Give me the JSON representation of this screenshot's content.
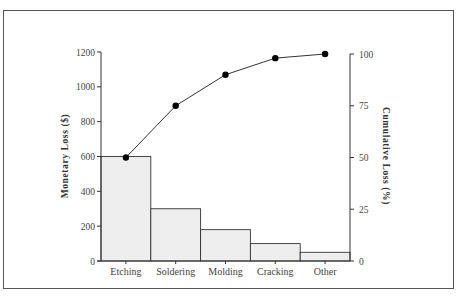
{
  "chart_data": {
    "type": "bar",
    "subtype": "pareto",
    "title": "",
    "categories": [
      "Etching",
      "Soldering",
      "Molding",
      "Cracking",
      "Other"
    ],
    "series": [
      {
        "name": "Monetary Loss ($)",
        "type": "bar",
        "axis": "left",
        "values": [
          600,
          300,
          180,
          100,
          50
        ]
      },
      {
        "name": "Cumulative Loss (%)",
        "type": "line",
        "axis": "right",
        "values": [
          50,
          75,
          90,
          98,
          100
        ]
      }
    ],
    "xlabel": "",
    "ylabel": "Monetary Loss ($)",
    "y2label": "Cumulative Loss (%)",
    "ylim": [
      0,
      1200
    ],
    "y2lim": [
      0,
      100
    ],
    "yticks": [
      "0",
      "200",
      "400",
      "600",
      "800",
      "1000",
      "1200"
    ],
    "y2ticks": [
      "0",
      "25",
      "50",
      "75",
      "100"
    ],
    "grid": false,
    "legend": "none",
    "colors": {
      "bar_fill": "#eeeeee",
      "bar_stroke": "#333333",
      "line": "#333333",
      "marker": "#000000"
    }
  }
}
